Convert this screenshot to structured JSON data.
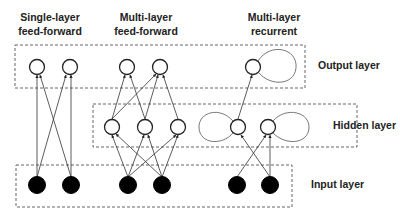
{
  "titles": {
    "single": [
      "Single-layer",
      "feed-forward"
    ],
    "multi": [
      "Multi-layer",
      "feed-forward"
    ],
    "recurrent": [
      "Multi-layer",
      "recurrent"
    ]
  },
  "layers": {
    "output": "Output layer",
    "hidden": "Hidden layer",
    "input": "Input layer"
  },
  "colors": {
    "stroke": "#222222",
    "box": "#444444",
    "input_fill": "#000000"
  }
}
